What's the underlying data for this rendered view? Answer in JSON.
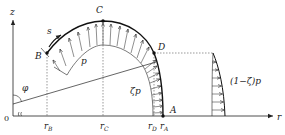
{
  "diagram": {
    "type": "shell-pressure-loading",
    "axes": {
      "vertical_label": "z",
      "horizontal_label": "r",
      "origin_label": "0"
    },
    "points": {
      "B": "B",
      "C": "C",
      "D": "D",
      "A": "A"
    },
    "radial_marks": {
      "rB": {
        "main": "r",
        "sub": "B"
      },
      "rC": {
        "main": "r",
        "sub": "C"
      },
      "rD": {
        "main": "r",
        "sub": "D"
      },
      "rA": {
        "main": "r",
        "sub": "A"
      }
    },
    "annotations": {
      "arc_coordinate": "s",
      "angle": "φ",
      "pressure": "p",
      "inner_pressure": "ζp",
      "outer_pressure": "(1−ζ)p"
    },
    "colors": {
      "line": "#222222",
      "dashed": "#555555",
      "background": "#ffffff"
    }
  }
}
